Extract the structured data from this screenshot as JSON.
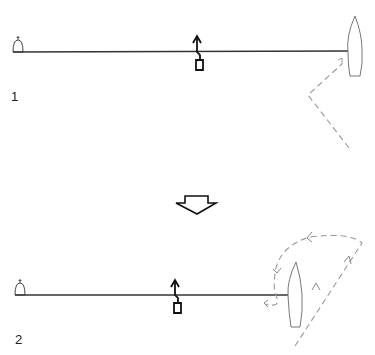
{
  "panels": [
    {
      "label": "1",
      "description": "Boat moored with line to buoy; dashed approach path to boat"
    },
    {
      "label": "2",
      "description": "Boat swung around; dashed circling path around boat"
    }
  ],
  "transition_arrow": "down-arrow",
  "colors": {
    "line": "#333333",
    "dashed": "#888888",
    "boat": "#777777"
  }
}
